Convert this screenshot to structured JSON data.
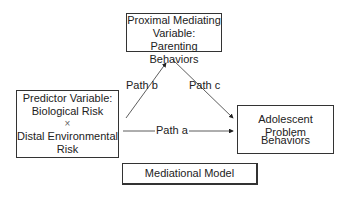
{
  "diagram": {
    "mediator": {
      "line1": "Proximal Mediating",
      "line2": "Variable:",
      "line3": "Parenting Behaviors"
    },
    "predictor": {
      "line1": "Predictor Variable:",
      "line2": "Biological Risk",
      "line3": "×",
      "line4": "Distal Environmental",
      "line5": "Risk"
    },
    "outcome": {
      "line1": "Adolescent Problem",
      "line2": "Behaviors"
    },
    "paths": {
      "a": "Path a",
      "b": "Path b",
      "c": "Path c"
    },
    "caption": "Mediational Model"
  }
}
